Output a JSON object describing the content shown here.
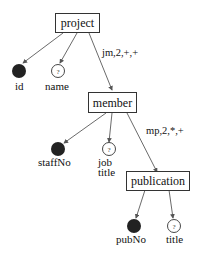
{
  "diagram": {
    "type": "schema-tree",
    "nodes": {
      "project": {
        "label": "project",
        "kind": "element"
      },
      "id": {
        "label": "id",
        "kind": "key-attribute"
      },
      "name": {
        "label": "name",
        "kind": "optional-attribute",
        "symbol": "?"
      },
      "member": {
        "label": "member",
        "kind": "element"
      },
      "staffNo": {
        "label": "staffNo",
        "kind": "key-attribute"
      },
      "job_title": {
        "label_line1": "job",
        "label_line2": "title",
        "kind": "optional-attribute",
        "symbol": "?"
      },
      "publication": {
        "label": "publication",
        "kind": "element"
      },
      "pubNo": {
        "label": "pubNo",
        "kind": "key-attribute"
      },
      "title": {
        "label": "title",
        "kind": "optional-attribute",
        "symbol": "?"
      }
    },
    "edges": [
      {
        "from": "project",
        "to": "id"
      },
      {
        "from": "project",
        "to": "name"
      },
      {
        "from": "project",
        "to": "member",
        "label": "jm,2,+,+"
      },
      {
        "from": "member",
        "to": "staffNo"
      },
      {
        "from": "member",
        "to": "job_title"
      },
      {
        "from": "member",
        "to": "publication",
        "label": "mp,2,*,+"
      },
      {
        "from": "publication",
        "to": "pubNo"
      },
      {
        "from": "publication",
        "to": "title"
      }
    ],
    "colors": {
      "line": "#333333",
      "filled": "#222222",
      "background": "#ffffff"
    }
  }
}
